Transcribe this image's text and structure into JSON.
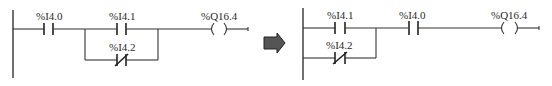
{
  "diagram": {
    "type": "ladder-logic-transformation",
    "colors": {
      "line": "#333333",
      "arrow_fill": "#555555",
      "arrow_stroke": "#222222",
      "background": "#ffffff"
    },
    "before": {
      "rung": [
        {
          "kind": "no-contact",
          "address": "%I4.0"
        },
        {
          "kind": "parallel-branch",
          "branches": [
            {
              "kind": "no-contact",
              "address": "%I4.1"
            },
            {
              "kind": "nc-contact",
              "address": "%I4.2"
            }
          ]
        },
        {
          "kind": "coil",
          "address": "%Q16.4"
        }
      ],
      "labels": {
        "c1": "%I4.0",
        "c2": "%I4.1",
        "c3": "%I4.2",
        "coil": "%Q16.4"
      }
    },
    "arrow": {
      "direction": "right",
      "meaning": "transforms-to"
    },
    "after": {
      "rung": [
        {
          "kind": "parallel-branch",
          "branches": [
            {
              "kind": "no-contact",
              "address": "%I4.1"
            },
            {
              "kind": "nc-contact",
              "address": "%I4.2"
            }
          ]
        },
        {
          "kind": "no-contact",
          "address": "%I4.0"
        },
        {
          "kind": "coil",
          "address": "%Q16.4"
        }
      ],
      "labels": {
        "c1": "%I4.1",
        "c2": "%I4.2",
        "c3": "%I4.0",
        "coil": "%Q16.4"
      }
    }
  }
}
